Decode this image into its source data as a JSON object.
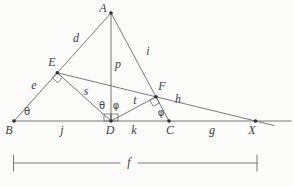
{
  "figure": {
    "kind": "geometry-diagram",
    "colors": {
      "background": "#fbfbf9",
      "line": "#6a6a6a",
      "text": "#3f3f3f"
    },
    "point_labels": {
      "A": "A",
      "B": "B",
      "C": "C",
      "D": "D",
      "E": "E",
      "F": "F",
      "X": "X"
    },
    "segment_labels": {
      "d": "d",
      "e": "e",
      "i": "i",
      "p": "p",
      "s": "s",
      "t": "t",
      "h": "h",
      "j": "j",
      "k": "k",
      "g": "g"
    },
    "angle_labels": {
      "theta": "θ",
      "phi": "φ"
    },
    "dimension": {
      "label": "f"
    }
  }
}
